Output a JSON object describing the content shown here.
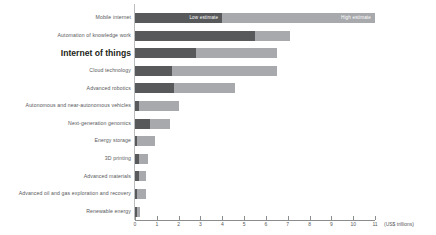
{
  "chart_data": {
    "type": "bar",
    "orientation": "horizontal",
    "stacked": true,
    "title": "",
    "xlabel": "(US$ trillions)",
    "ylabel": "",
    "xlim": [
      0,
      11
    ],
    "xticks": [
      0,
      1,
      2,
      3,
      4,
      5,
      6,
      7,
      8,
      9,
      10,
      11
    ],
    "xtick_labels": [
      "0",
      "1",
      "2",
      "3",
      "4",
      "5",
      "6",
      "7",
      "8",
      "9",
      "10",
      "11"
    ],
    "grid": false,
    "legend": [
      "Low estimate",
      "High estimate"
    ],
    "legend_position": "in-bar-first-row",
    "categories": [
      "Mobile internet",
      "Automation of knowledge work",
      "Internet of things",
      "Cloud technology",
      "Advanced robotics",
      "Autonomous and near-autonomous vehicles",
      "Next-generation genomics",
      "Energy storage",
      "3D printing",
      "Advanced materials",
      "Advanced oil and gas exploration and recovery",
      "Renewable energy"
    ],
    "highlighted_category": "Internet of things",
    "series": [
      {
        "name": "Low estimate",
        "values": [
          4.0,
          5.5,
          2.8,
          1.7,
          1.8,
          0.2,
          0.7,
          0.1,
          0.2,
          0.2,
          0.1,
          0.1
        ]
      },
      {
        "name": "High estimate",
        "values": [
          11.0,
          7.1,
          6.5,
          6.5,
          4.6,
          2.0,
          1.6,
          0.9,
          0.6,
          0.5,
          0.5,
          0.25
        ]
      }
    ]
  },
  "colors": {
    "low_estimate": "#58595b",
    "high_estimate": "#a7a9ac",
    "axis": "#8a8c8e",
    "label_text": "#58595b",
    "highlight_text": "#231f20"
  },
  "axis": {
    "unit_label": "(US$ trillions)"
  },
  "labels": {
    "low_estimate": "Low estimate",
    "high_estimate": "High estimate"
  }
}
